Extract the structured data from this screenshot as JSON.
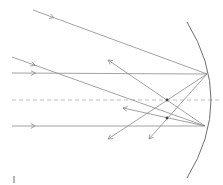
{
  "diagram": {
    "type": "concave-mirror-ray-diagram",
    "colors": {
      "ray": "#8a8a8a",
      "mirror": "#6e6e6e",
      "axis": "#b0b0b0",
      "point": "#444444",
      "background": "#ffffff"
    },
    "principal_axis": {
      "y": 100,
      "x1": 12,
      "x2": 220,
      "style": "dashed"
    },
    "mirror": {
      "top": [
        187,
        22
      ],
      "mid": [
        211,
        100
      ],
      "bottom": [
        187,
        178
      ]
    },
    "incident_rays": [
      {
        "from": [
          33,
          10
        ],
        "to": [
          207,
          74
        ]
      },
      {
        "from": [
          12,
          57
        ],
        "to": [
          205,
          126
        ]
      },
      {
        "from": [
          12,
          73
        ],
        "to": [
          207,
          74
        ]
      },
      {
        "from": [
          12,
          126
        ],
        "to": [
          205,
          126
        ]
      }
    ],
    "reflected_rays": [
      {
        "from": [
          207,
          74
        ],
        "to": [
          108,
          139
        ]
      },
      {
        "from": [
          207,
          74
        ],
        "to": [
          149,
          139
        ]
      },
      {
        "from": [
          205,
          126
        ],
        "to": [
          108,
          60
        ]
      },
      {
        "from": [
          205,
          126
        ],
        "to": [
          123,
          108
        ]
      }
    ],
    "points": [
      {
        "name": "focal-point-axis",
        "x": 167,
        "y": 100
      },
      {
        "name": "focal-point-oblique",
        "x": 167,
        "y": 118
      }
    ],
    "tick_mark": {
      "x": 14,
      "y1": 176,
      "y2": 183
    }
  }
}
